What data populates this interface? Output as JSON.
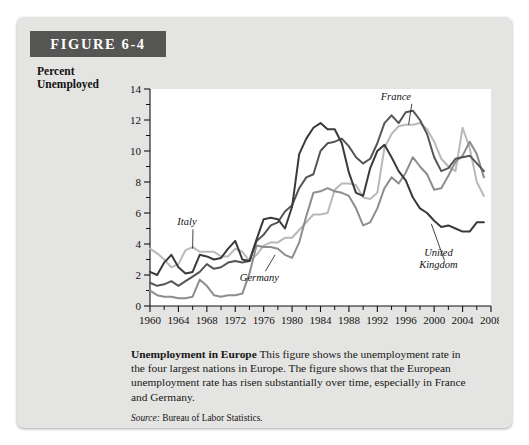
{
  "figure": {
    "banner_label": "FIGURE 6-4"
  },
  "axis": {
    "y_title": "Percent\nUnemployed",
    "x_title": "Year"
  },
  "caption": {
    "title": "Unemployment in Europe",
    "body": " This figure shows the unemployment rate in the four largest nations in Europe. The figure shows that the European unemployment rate has risen substantially over time, especially in France and Germany.",
    "source_word": "Source:",
    "source_text": " Bureau of Labor Statistics."
  },
  "colors": {
    "panel": "#e4e4e2",
    "banner": "#555553",
    "plot_background": "#ffffff",
    "united_kingdom": "#3a3a3a",
    "france": "#555555",
    "germany": "#8d8d8d",
    "italy": "#b9b9b9"
  },
  "chart_data": {
    "type": "line",
    "title": "Unemployment in Europe",
    "xlabel": "Year",
    "ylabel": "Percent Unemployed",
    "xlim": [
      1960,
      2008
    ],
    "ylim": [
      0,
      14
    ],
    "ytick_step": 2,
    "yticks": [
      0,
      2,
      4,
      6,
      8,
      10,
      12,
      14
    ],
    "minor_ytick_step": 1,
    "xticks": [
      1960,
      1964,
      1968,
      1972,
      1976,
      1980,
      1984,
      1988,
      1992,
      1996,
      2000,
      2004,
      2008
    ],
    "minor_xtick_step": 2,
    "grid": false,
    "legend": "inline-annotations",
    "annotations": [
      {
        "label": "Italy",
        "x": 1965.2,
        "y": 5.2,
        "leader_to_x": 1966.0,
        "leader_to_y": 3.7
      },
      {
        "label": "Germany",
        "x": 1975.4,
        "y": 1.6,
        "leader_to_x": 1977.6,
        "leader_to_y": 3.3
      },
      {
        "label": "France",
        "x": 1994.6,
        "y": 13.3,
        "leader_to_x": 1996.4,
        "leader_to_y": 11.7
      },
      {
        "label": "United Kingdom",
        "x": 2000.6,
        "y": 3.2,
        "leader_to_x": 1999.6,
        "leader_to_y": 5.3
      }
    ],
    "x": [
      1960,
      1961,
      1962,
      1963,
      1964,
      1965,
      1966,
      1967,
      1968,
      1969,
      1970,
      1971,
      1972,
      1973,
      1974,
      1975,
      1976,
      1977,
      1978,
      1979,
      1980,
      1981,
      1982,
      1983,
      1984,
      1985,
      1986,
      1987,
      1988,
      1989,
      1990,
      1991,
      1992,
      1993,
      1994,
      1995,
      1996,
      1997,
      1998,
      1999,
      2000,
      2001,
      2002,
      2003,
      2004,
      2005,
      2006,
      2007
    ],
    "series": [
      {
        "name": "France",
        "color": "#555555",
        "values": [
          1.5,
          1.3,
          1.4,
          1.6,
          1.3,
          1.6,
          1.9,
          2.2,
          2.7,
          2.4,
          2.5,
          2.8,
          2.9,
          2.8,
          2.9,
          4.2,
          4.6,
          5.2,
          5.4,
          6.1,
          6.5,
          7.6,
          8.3,
          8.5,
          10.0,
          10.5,
          10.6,
          10.8,
          10.3,
          9.6,
          9.2,
          9.5,
          10.5,
          11.8,
          12.3,
          11.8,
          12.5,
          12.6,
          12.0,
          11.1,
          9.6,
          8.7,
          8.9,
          9.5,
          9.6,
          9.7,
          9.2,
          8.7
        ]
      },
      {
        "name": "Italy",
        "color": "#b9b9b9",
        "values": [
          3.7,
          3.4,
          3.0,
          2.5,
          2.7,
          3.6,
          3.8,
          3.5,
          3.5,
          3.5,
          3.2,
          3.2,
          3.7,
          3.5,
          2.9,
          3.3,
          3.9,
          4.1,
          4.1,
          4.4,
          4.4,
          4.9,
          5.4,
          5.9,
          5.9,
          6.0,
          7.5,
          7.9,
          7.9,
          7.8,
          7.0,
          6.9,
          7.3,
          10.2,
          11.1,
          11.6,
          11.7,
          11.7,
          11.8,
          11.4,
          10.6,
          9.5,
          9.0,
          8.7,
          11.5,
          10.2,
          8.0,
          7.1
        ]
      },
      {
        "name": "Germany",
        "color": "#8d8d8d",
        "values": [
          1.0,
          0.7,
          0.6,
          0.6,
          0.5,
          0.5,
          0.6,
          1.7,
          1.3,
          0.7,
          0.6,
          0.7,
          0.7,
          0.8,
          2.1,
          3.9,
          3.8,
          3.8,
          3.7,
          3.3,
          3.1,
          4.1,
          5.8,
          7.3,
          7.4,
          7.6,
          7.4,
          7.3,
          7.1,
          6.3,
          5.2,
          5.4,
          6.3,
          7.6,
          8.3,
          7.9,
          8.6,
          9.6,
          9.0,
          8.5,
          7.5,
          7.6,
          8.4,
          9.3,
          9.7,
          10.6,
          9.8,
          8.3
        ]
      },
      {
        "name": "United Kingdom",
        "color": "#3a3a3a",
        "values": [
          2.2,
          2.0,
          2.8,
          3.3,
          2.5,
          2.1,
          2.2,
          3.3,
          3.2,
          3.0,
          3.1,
          3.7,
          4.2,
          3.0,
          2.9,
          4.3,
          5.6,
          5.7,
          5.6,
          5.0,
          6.4,
          9.8,
          10.8,
          11.5,
          11.8,
          11.4,
          11.4,
          10.5,
          8.6,
          7.3,
          7.1,
          8.9,
          10.0,
          10.4,
          9.6,
          8.7,
          8.1,
          7.0,
          6.3,
          6.0,
          5.5,
          5.1,
          5.2,
          5.0,
          4.8,
          4.8,
          5.4,
          5.4
        ]
      }
    ]
  }
}
